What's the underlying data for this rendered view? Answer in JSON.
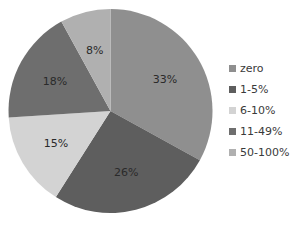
{
  "chart_data": {
    "type": "pie",
    "title": "",
    "categories": [
      "zero",
      "1-5%",
      "6-10%",
      "11-49%",
      "50-100%"
    ],
    "values": [
      33,
      26,
      15,
      18,
      8
    ],
    "labels": [
      "33%",
      "26%",
      "15%",
      "18%",
      "8%"
    ],
    "colors": [
      "#8f8f8f",
      "#5e5e5e",
      "#d3d3d3",
      "#6e6e6e",
      "#b0b0b0"
    ],
    "start_angle": "12 o'clock",
    "direction": "clockwise",
    "legend_position": "right"
  },
  "legend": {
    "items": [
      {
        "label": "zero",
        "color": "#8f8f8f"
      },
      {
        "label": "1-5%",
        "color": "#5e5e5e"
      },
      {
        "label": "6-10%",
        "color": "#d3d3d3"
      },
      {
        "label": "11-49%",
        "color": "#6e6e6e"
      },
      {
        "label": "50-100%",
        "color": "#b0b0b0"
      }
    ]
  }
}
